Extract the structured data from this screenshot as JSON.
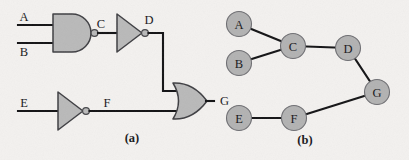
{
  "figure": {
    "background_color": "#f3f1ef",
    "ink_color": "#131315",
    "gate_fill_color": "#b9b9b9",
    "gate_stroke_color": "#3e3e42",
    "node_fill_color": "#b2b2b2",
    "node_stroke_color": "#6e6e72",
    "panels": [
      {
        "id": "a",
        "caption": "(a)",
        "caption_x": 132,
        "caption_y": 142
      },
      {
        "id": "b",
        "caption": "(b)",
        "caption_x": 305,
        "caption_y": 144
      }
    ]
  },
  "circuit": {
    "signal_labels": [
      {
        "name": "A",
        "text": "A",
        "x": 24,
        "y": 25
      },
      {
        "name": "B",
        "text": "B",
        "x": 24,
        "y": 53
      },
      {
        "name": "C",
        "text": "C",
        "x": 95,
        "y": 30
      },
      {
        "name": "D",
        "text": "D",
        "x": 147,
        "y": 27
      },
      {
        "name": "E",
        "text": "E",
        "x": 24,
        "y": 104
      },
      {
        "name": "F",
        "text": "F",
        "x": 106,
        "y": 104
      },
      {
        "name": "G",
        "text": "G",
        "x": 217,
        "y": 102
      }
    ],
    "gates": [
      {
        "name": "nand-gate",
        "type": "NAND",
        "label": "C",
        "inputs": [
          "A",
          "B"
        ],
        "output": "C",
        "inverted_output": true
      },
      {
        "name": "inverter-d",
        "type": "NOT",
        "label": "D",
        "inputs": [
          "C"
        ],
        "output": "D",
        "inverted_output": true
      },
      {
        "name": "inverter-f",
        "type": "NOT",
        "label": "F",
        "inputs": [
          "E"
        ],
        "output": "F",
        "inverted_output": true
      },
      {
        "name": "or-gate",
        "type": "OR",
        "label": "G",
        "inputs": [
          "D",
          "F"
        ],
        "output": "G",
        "inverted_output": false
      }
    ]
  },
  "graph": {
    "nodes": [
      {
        "id": "A",
        "label": "A",
        "cx": 239,
        "cy": 24,
        "r": 12.5
      },
      {
        "id": "B",
        "label": "B",
        "cx": 239,
        "cy": 63,
        "r": 12.5
      },
      {
        "id": "C",
        "label": "C",
        "cx": 293,
        "cy": 46,
        "r": 12.5
      },
      {
        "id": "D",
        "label": "D",
        "cx": 348,
        "cy": 48,
        "r": 12.5
      },
      {
        "id": "E",
        "label": "E",
        "cx": 239,
        "cy": 118,
        "r": 12.5
      },
      {
        "id": "F",
        "label": "F",
        "cx": 294,
        "cy": 118,
        "r": 12.5
      },
      {
        "id": "G",
        "label": "G",
        "cx": 377,
        "cy": 92,
        "r": 12.5
      }
    ],
    "edges": [
      {
        "from": "A",
        "to": "C"
      },
      {
        "from": "B",
        "to": "C"
      },
      {
        "from": "C",
        "to": "D"
      },
      {
        "from": "D",
        "to": "G"
      },
      {
        "from": "E",
        "to": "F"
      },
      {
        "from": "F",
        "to": "G"
      }
    ]
  }
}
